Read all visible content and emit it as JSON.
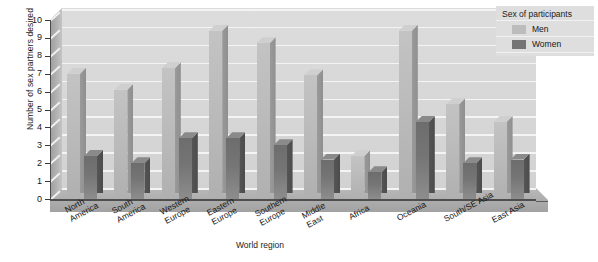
{
  "chart_data": {
    "type": "bar",
    "title": "",
    "xlabel": "World region",
    "ylabel": "Number of sex partners desired",
    "ylim": [
      0,
      10
    ],
    "ytick_labels": [
      "10",
      "9",
      "8",
      "7",
      "6",
      "5",
      "4",
      "3",
      "2",
      "1",
      "0"
    ],
    "grid": true,
    "legend_position": "top-right",
    "legend_title": "Sex of participants",
    "categories": [
      "North\nAmerica",
      "South\nAmerica",
      "Western\nEurope",
      "Eastern\nEurope",
      "Southern\nEurope",
      "Middle\nEast",
      "Africa",
      "Oceania",
      "South/SE Asia",
      "East Asia"
    ],
    "series": [
      {
        "name": "Men",
        "color": "#bcbcbc",
        "values": [
          7.0,
          6.1,
          7.3,
          9.4,
          8.7,
          6.9,
          2.4,
          9.4,
          5.3,
          4.3
        ]
      },
      {
        "name": "Women",
        "color": "#757575",
        "values": [
          2.4,
          2.0,
          3.4,
          3.4,
          3.0,
          2.2,
          1.5,
          4.3,
          2.0,
          2.2
        ]
      }
    ]
  },
  "legend": {
    "title": "Sex of participants",
    "entries": [
      {
        "label": "Men",
        "color": "#bcbcbc"
      },
      {
        "label": "Women",
        "color": "#757575"
      }
    ]
  },
  "axes": {
    "y_title": "Number of sex partners desired",
    "x_title": "World region"
  }
}
